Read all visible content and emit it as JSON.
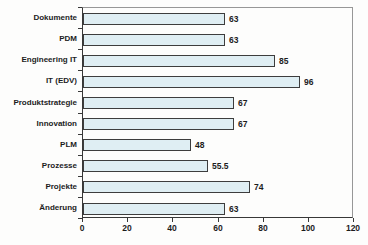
{
  "chart_data": {
    "type": "bar",
    "orientation": "horizontal",
    "title": "",
    "xlabel": "",
    "ylabel": "",
    "categories": [
      "Dokumente",
      "PDM",
      "Engineering IT",
      "IT (EDV)",
      "Produktstrategie",
      "Innovation",
      "PLM",
      "Prozesse",
      "Projekte",
      "Änderung"
    ],
    "values": [
      63,
      63,
      85,
      96,
      67,
      67,
      48,
      55.5,
      74,
      63
    ],
    "value_labels": [
      "63",
      "63",
      "85",
      "96",
      "67",
      "67",
      "48",
      "55.5",
      "74",
      "63"
    ],
    "xlim": [
      0,
      120
    ],
    "x_ticks": [
      0,
      20,
      40,
      60,
      80,
      100,
      120
    ],
    "grid": false,
    "legend": "none",
    "colors": {
      "bar_fill": "#dfeef3",
      "bar_border": "#3d3d3d",
      "axis": "#383838",
      "plot_border": "#979797",
      "text": "#1c1c1c",
      "background": "#fdfdfc"
    }
  }
}
